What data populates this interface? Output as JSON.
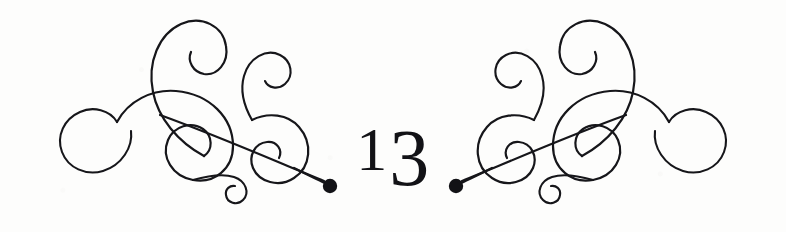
{
  "document": {
    "kind": "chapter-opening-ornament",
    "chapter_number": "13",
    "digits": {
      "first": "1",
      "second": "3"
    }
  },
  "colors": {
    "background": "#fdfdfc",
    "ink": "#16161a",
    "number_ink": "#121216"
  },
  "ornaments": {
    "left": {
      "name": "calligraphic-flourish-left",
      "terminal": "dot"
    },
    "right": {
      "name": "calligraphic-flourish-right",
      "terminal": "dot"
    }
  }
}
